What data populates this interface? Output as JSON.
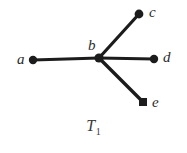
{
  "figure": {
    "caption_base": "T",
    "caption_subscript": "1",
    "background_color": "#ffffff",
    "ink_color": "#1c1c1c",
    "label_color": "#2b2b2b"
  },
  "labels": {
    "a": "a",
    "b": "b",
    "c": "c",
    "d": "d",
    "e": "e"
  },
  "chart_data": {
    "type": "diagram",
    "title": "T1",
    "nodes": [
      {
        "id": "a",
        "label": "a",
        "x": 33,
        "y": 60,
        "marker": "disc",
        "radius": 4.2,
        "label_x": 17,
        "label_y": 52
      },
      {
        "id": "b",
        "label": "b",
        "x": 99,
        "y": 58,
        "marker": "disc",
        "radius": 4.6,
        "label_x": 88,
        "label_y": 38
      },
      {
        "id": "c",
        "label": "c",
        "x": 139,
        "y": 14,
        "marker": "disc",
        "radius": 4.4,
        "label_x": 149,
        "label_y": 5
      },
      {
        "id": "d",
        "label": "d",
        "x": 154,
        "y": 59,
        "marker": "disc",
        "radius": 4.2,
        "label_x": 163,
        "label_y": 50
      },
      {
        "id": "e",
        "label": "e",
        "x": 143,
        "y": 102,
        "marker": "square",
        "radius": 4.0,
        "label_x": 152,
        "label_y": 95
      }
    ],
    "edges": [
      {
        "from": "a",
        "to": "b",
        "width": 3.0
      },
      {
        "from": "b",
        "to": "c",
        "width": 3.2
      },
      {
        "from": "b",
        "to": "d",
        "width": 3.0
      },
      {
        "from": "b",
        "to": "e",
        "width": 3.4
      }
    ],
    "xlim": [
      0,
      187
    ],
    "ylim": [
      0,
      153
    ],
    "grid": false,
    "legend": null
  }
}
